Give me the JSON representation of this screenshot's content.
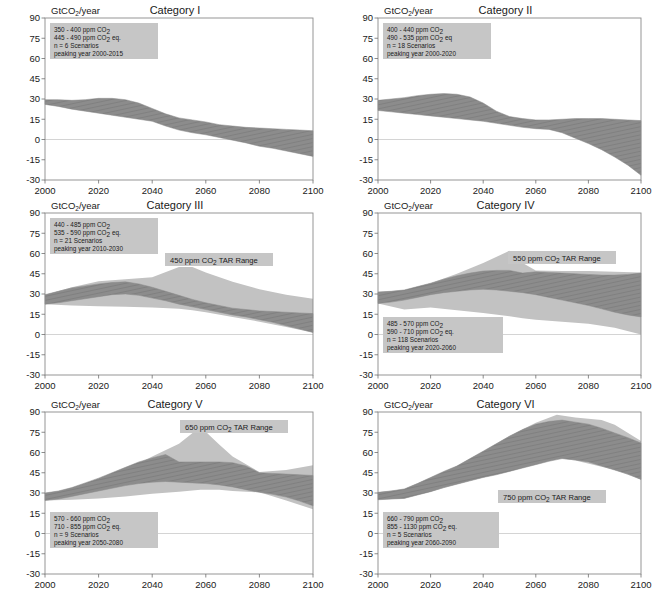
{
  "figure": {
    "axis_label": "GtCO2/year",
    "axis_label_main": "GtCO",
    "axis_label_sub": "2",
    "axis_label_tail": "/year",
    "y_ticks": [
      90,
      75,
      60,
      45,
      30,
      15,
      0,
      -15,
      -30
    ],
    "x_ticks": [
      2000,
      2020,
      2040,
      2060,
      2080,
      2100
    ],
    "ylim": [
      -30,
      90
    ],
    "xlim": [
      2000,
      2100
    ],
    "colors": {
      "scenario_band": "#8c8c8c",
      "tar_band": "#c2c2c2",
      "annotation_box": "#c6c6c6",
      "frame": "#8a8a8a",
      "zero_line": "#c9c9c9",
      "text": "#1a1a1a"
    }
  },
  "chart_data": [
    {
      "type": "area",
      "title": "Category I",
      "xlabel": "",
      "ylabel": "GtCO2/year",
      "xlim": [
        2000,
        2100
      ],
      "ylim": [
        -30,
        90
      ],
      "grid": false,
      "annotation": {
        "line1_a": "350 - 400 ppm CO",
        "line1_sub": "2",
        "line1_b": "",
        "line2_a": "445 - 490 ppm CO",
        "line2_sub": "2",
        "line2_b": " eq.",
        "line3": "n = 6 Scenarios",
        "line4": "peaking year 2000-2015"
      },
      "tar_label": null,
      "series": [
        {
          "name": "scenario range",
          "x": [
            2000,
            2005,
            2010,
            2015,
            2020,
            2025,
            2030,
            2035,
            2040,
            2045,
            2050,
            2055,
            2060,
            2065,
            2070,
            2075,
            2080,
            2085,
            2090,
            2095,
            2100
          ],
          "upper": [
            29.5,
            29.5,
            29.0,
            29.5,
            30.5,
            30.5,
            29.5,
            27.0,
            23.0,
            19.0,
            16.0,
            14.5,
            13.0,
            11.0,
            10.0,
            9.0,
            8.5,
            8.0,
            7.5,
            7.0,
            6.5
          ],
          "lower": [
            26.0,
            24.5,
            22.5,
            21.0,
            19.5,
            18.0,
            16.5,
            15.0,
            13.5,
            10.0,
            7.0,
            5.0,
            3.5,
            1.5,
            -0.5,
            -2.5,
            -5.0,
            -6.5,
            -8.5,
            -10.5,
            -12.5
          ]
        }
      ]
    },
    {
      "type": "area",
      "title": "Category II",
      "xlabel": "",
      "ylabel": "GtCO2/year",
      "xlim": [
        2000,
        2100
      ],
      "ylim": [
        -30,
        90
      ],
      "grid": false,
      "annotation": {
        "line1_a": "400 - 440 ppm CO",
        "line1_sub": "2",
        "line1_b": "",
        "line2_a": "490 - 535 ppm CO",
        "line2_sub": "2",
        "line2_b": " eq",
        "line3": "n = 18 Scenarios",
        "line4": "peaking year 2000-2020"
      },
      "tar_label": null,
      "series": [
        {
          "name": "scenario range",
          "x": [
            2000,
            2005,
            2010,
            2015,
            2020,
            2025,
            2030,
            2035,
            2040,
            2045,
            2050,
            2055,
            2060,
            2065,
            2070,
            2075,
            2080,
            2085,
            2090,
            2095,
            2100
          ],
          "upper": [
            29.0,
            30.0,
            31.0,
            32.5,
            33.5,
            34.0,
            33.5,
            31.5,
            27.0,
            21.0,
            17.0,
            15.5,
            14.5,
            14.5,
            15.0,
            15.5,
            15.5,
            15.5,
            15.0,
            14.5,
            14.0
          ],
          "lower": [
            21.5,
            20.5,
            19.5,
            18.5,
            17.5,
            16.5,
            15.5,
            14.5,
            13.5,
            12.0,
            10.5,
            9.0,
            8.0,
            7.5,
            5.0,
            1.0,
            -3.0,
            -7.5,
            -13.0,
            -19.0,
            -26.5
          ]
        }
      ]
    },
    {
      "type": "area",
      "title": "Category III",
      "xlabel": "",
      "ylabel": "GtCO2/year",
      "xlim": [
        2000,
        2100
      ],
      "ylim": [
        -30,
        90
      ],
      "grid": false,
      "annotation": {
        "line1_a": "440 - 485 ppm CO",
        "line1_sub": "2",
        "line1_b": "",
        "line2_a": "535 - 590 ppm CO",
        "line2_sub": "2",
        "line2_b": " eq.",
        "line3": "n = 21 Scenarios",
        "line4": "peaking year 2010-2030"
      },
      "tar_label": {
        "prefix": "450 ppm CO",
        "sub": "2",
        "suffix": " TAR Range"
      },
      "series": [
        {
          "name": "TAR range",
          "x": [
            2000,
            2010,
            2020,
            2030,
            2040,
            2050,
            2055,
            2060,
            2070,
            2080,
            2090,
            2100
          ],
          "upper": [
            29.5,
            35.0,
            39.5,
            41.0,
            42.5,
            50.0,
            50.0,
            46.0,
            39.0,
            33.5,
            29.5,
            26.5
          ],
          "lower": [
            22.5,
            21.5,
            21.0,
            20.5,
            20.0,
            19.0,
            18.0,
            16.5,
            13.0,
            9.5,
            5.5,
            1.5
          ]
        },
        {
          "name": "scenario range",
          "x": [
            2000,
            2005,
            2010,
            2015,
            2020,
            2025,
            2030,
            2035,
            2040,
            2045,
            2050,
            2055,
            2060,
            2065,
            2070,
            2075,
            2080,
            2085,
            2090,
            2095,
            2100
          ],
          "upper": [
            29.5,
            32.0,
            34.5,
            36.0,
            37.5,
            38.5,
            39.0,
            37.5,
            35.0,
            32.0,
            29.0,
            26.0,
            23.5,
            21.5,
            19.5,
            18.5,
            17.5,
            17.0,
            16.5,
            16.0,
            15.5
          ],
          "lower": [
            22.5,
            23.5,
            25.0,
            26.5,
            28.0,
            29.5,
            30.0,
            29.0,
            27.0,
            25.0,
            22.5,
            20.5,
            18.5,
            16.5,
            14.5,
            13.0,
            11.0,
            9.0,
            6.5,
            4.0,
            1.5
          ]
        }
      ]
    },
    {
      "type": "area",
      "title": "Category IV",
      "xlabel": "",
      "ylabel": "GtCO2/year",
      "xlim": [
        2000,
        2100
      ],
      "ylim": [
        -30,
        90
      ],
      "grid": false,
      "annotation": {
        "line1_a": "485 - 570 ppm CO",
        "line1_sub": "2",
        "line1_b": "",
        "line2_a": "590 - 710 ppm CO",
        "line2_sub": "2",
        "line2_b": " eq.",
        "line3": "n = 118 Scenarios",
        "line4": "peaking year 2020-2060"
      },
      "tar_label": {
        "prefix": "550 ppm CO",
        "sub": "2",
        "suffix": " TAR Range"
      },
      "series": [
        {
          "name": "TAR range",
          "x": [
            2000,
            2010,
            2020,
            2030,
            2040,
            2050,
            2055,
            2060,
            2070,
            2080,
            2090,
            2100
          ],
          "upper": [
            31.5,
            33.0,
            38.0,
            45.0,
            53.0,
            62.0,
            53.0,
            47.5,
            47.0,
            47.0,
            46.5,
            46.0
          ],
          "lower": [
            23.0,
            18.5,
            20.0,
            18.0,
            16.0,
            13.5,
            12.0,
            11.0,
            9.5,
            8.0,
            5.0,
            0.0
          ]
        },
        {
          "name": "scenario range",
          "x": [
            2000,
            2005,
            2010,
            2015,
            2020,
            2025,
            2030,
            2035,
            2040,
            2045,
            2050,
            2055,
            2060,
            2065,
            2070,
            2075,
            2080,
            2085,
            2090,
            2095,
            2100
          ],
          "upper": [
            31.5,
            32.0,
            33.0,
            35.5,
            38.0,
            41.0,
            43.5,
            45.5,
            47.0,
            47.5,
            47.5,
            45.5,
            46.5,
            46.0,
            45.5,
            45.0,
            44.5,
            44.0,
            44.0,
            44.5,
            45.5
          ],
          "lower": [
            23.0,
            24.0,
            25.5,
            27.5,
            29.5,
            31.0,
            32.0,
            33.0,
            33.5,
            33.0,
            32.0,
            31.0,
            29.5,
            27.5,
            25.5,
            23.5,
            21.5,
            19.0,
            16.5,
            14.5,
            13.0
          ]
        }
      ]
    },
    {
      "type": "area",
      "title": "Category V",
      "xlabel": "",
      "ylabel": "GtCO2/year",
      "xlim": [
        2000,
        2100
      ],
      "ylim": [
        -30,
        90
      ],
      "grid": false,
      "annotation": {
        "line1_a": "570 - 660 ppm CO",
        "line1_sub": "2",
        "line1_b": "",
        "line2_a": "710 - 855 ppm CO",
        "line2_sub": "2",
        "line2_b": " eq.",
        "line3": "n = 9 Scenarios",
        "line4": "peaking year 2050-2080"
      },
      "tar_label": {
        "prefix": "650 ppm CO",
        "sub": "2",
        "suffix": " TAR Range"
      },
      "series": [
        {
          "name": "TAR range",
          "x": [
            2000,
            2010,
            2020,
            2030,
            2040,
            2050,
            2058,
            2065,
            2070,
            2080,
            2090,
            2100
          ],
          "upper": [
            30.0,
            33.0,
            39.0,
            47.0,
            57.0,
            66.5,
            79.0,
            66.0,
            57.0,
            45.5,
            47.0,
            50.5
          ],
          "lower": [
            24.5,
            25.0,
            26.0,
            27.5,
            29.5,
            31.0,
            32.5,
            32.5,
            31.5,
            30.5,
            24.5,
            18.0
          ]
        },
        {
          "name": "scenario range",
          "x": [
            2000,
            2005,
            2010,
            2015,
            2020,
            2025,
            2030,
            2035,
            2040,
            2045,
            2050,
            2055,
            2060,
            2065,
            2070,
            2075,
            2080,
            2085,
            2090,
            2095,
            2100
          ],
          "upper": [
            30.0,
            31.5,
            34.0,
            37.5,
            41.0,
            45.0,
            49.0,
            53.0,
            56.0,
            58.5,
            53.0,
            53.0,
            53.0,
            53.0,
            52.5,
            50.0,
            45.0,
            44.5,
            44.0,
            43.5,
            43.0
          ],
          "lower": [
            24.5,
            25.5,
            27.5,
            29.5,
            31.5,
            33.5,
            35.5,
            37.0,
            38.0,
            38.5,
            38.0,
            37.5,
            37.0,
            36.0,
            34.5,
            32.5,
            30.5,
            29.0,
            27.0,
            24.0,
            20.5
          ]
        }
      ]
    },
    {
      "type": "area",
      "title": "Category VI",
      "xlabel": "",
      "ylabel": "GtCO2/year",
      "xlim": [
        2000,
        2100
      ],
      "ylim": [
        -30,
        90
      ],
      "grid": false,
      "annotation": {
        "line1_a": "660 - 790 ppm CO",
        "line1_sub": "2",
        "line1_b": "",
        "line2_a": "855 - 1130 ppm CO",
        "line2_sub": "2",
        "line2_b": " eq.",
        "line3": "n = 5 Scenarios",
        "line4": "peaking year 2060-2090"
      },
      "tar_label": {
        "prefix": "750 ppm CO",
        "sub": "2",
        "suffix": " TAR Range"
      },
      "series": [
        {
          "name": "TAR range",
          "x": [
            2000,
            2010,
            2020,
            2030,
            2040,
            2050,
            2060,
            2068,
            2075,
            2085,
            2090,
            2100
          ],
          "upper": [
            30.5,
            33.0,
            41.5,
            50.0,
            61.0,
            72.5,
            82.0,
            88.0,
            86.0,
            84.0,
            80.5,
            68.5
          ],
          "lower": [
            25.0,
            26.0,
            31.0,
            36.5,
            41.5,
            46.0,
            51.5,
            56.0,
            54.0,
            49.5,
            47.0,
            40.0
          ]
        },
        {
          "name": "scenario range",
          "x": [
            2000,
            2005,
            2010,
            2015,
            2020,
            2025,
            2030,
            2035,
            2040,
            2045,
            2050,
            2055,
            2060,
            2065,
            2070,
            2075,
            2080,
            2085,
            2090,
            2095,
            2100
          ],
          "upper": [
            30.5,
            31.5,
            33.0,
            37.0,
            41.5,
            46.0,
            50.0,
            55.5,
            61.0,
            66.5,
            72.0,
            77.0,
            81.0,
            83.0,
            84.0,
            82.5,
            81.0,
            78.0,
            74.5,
            71.0,
            67.0
          ],
          "lower": [
            25.0,
            25.5,
            26.0,
            28.5,
            31.0,
            34.0,
            36.5,
            39.0,
            41.5,
            43.5,
            46.0,
            48.5,
            51.0,
            53.5,
            55.5,
            54.5,
            53.0,
            50.0,
            47.0,
            44.0,
            40.0
          ]
        }
      ]
    }
  ]
}
